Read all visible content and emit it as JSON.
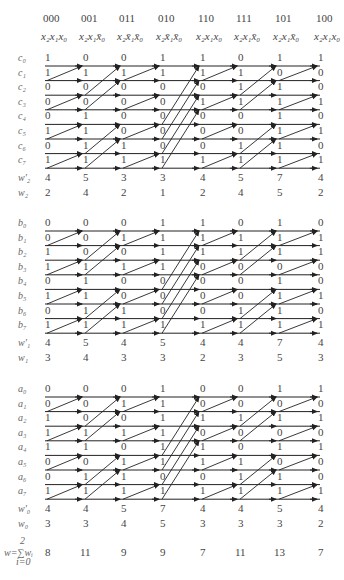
{
  "columns": [
    {
      "code": "000",
      "term": "x₂x₁x₀"
    },
    {
      "code": "001",
      "term": "x₂x₁x̄₀"
    },
    {
      "code": "011",
      "term": "x₂x̄₁x̄₀"
    },
    {
      "code": "010",
      "term": "x₂x̄₁x̄₀"
    },
    {
      "code": "110",
      "term": "x₂x₁x₀"
    },
    {
      "code": "111",
      "term": "x₂x₁x̄₀"
    },
    {
      "code": "101",
      "term": "x₂x₁x̄₀"
    },
    {
      "code": "100",
      "term": "x₂x₁x₀"
    }
  ],
  "sections": [
    {
      "name": "c",
      "row_labels": [
        "c₀",
        "c₁",
        "c₂",
        "c₃",
        "c₄",
        "c₅",
        "c₆",
        "c₇"
      ],
      "bits": [
        [
          1,
          1,
          0,
          0,
          0,
          1,
          0,
          1
        ],
        [
          0,
          1,
          0,
          0,
          1,
          1,
          1,
          1
        ],
        [
          0,
          1,
          0,
          0,
          0,
          0,
          1,
          1
        ],
        [
          1,
          1,
          0,
          0,
          0,
          0,
          0,
          1
        ],
        [
          1,
          1,
          0,
          1,
          0,
          0,
          0,
          1
        ],
        [
          0,
          1,
          1,
          1,
          0,
          0,
          1,
          1
        ],
        [
          1,
          0,
          1,
          1,
          1,
          1,
          1,
          1
        ],
        [
          1,
          0,
          0,
          1,
          0,
          1,
          0,
          1
        ]
      ],
      "wprime_label": "w'₂",
      "wprime": [
        4,
        5,
        3,
        3,
        4,
        5,
        7,
        4
      ],
      "w_label": "w₂",
      "w": [
        2,
        4,
        2,
        1,
        2,
        4,
        5,
        2
      ]
    },
    {
      "name": "b",
      "row_labels": [
        "b₀",
        "b₁",
        "b₂",
        "b₃",
        "b₄",
        "b₅",
        "b₆",
        "b₇"
      ],
      "bits": [
        [
          0,
          0,
          1,
          1,
          0,
          1,
          0,
          1
        ],
        [
          0,
          0,
          0,
          1,
          1,
          1,
          1,
          1
        ],
        [
          0,
          1,
          0,
          1,
          0,
          0,
          1,
          1
        ],
        [
          1,
          1,
          1,
          1,
          0,
          0,
          0,
          1
        ],
        [
          1,
          1,
          1,
          0,
          0,
          0,
          0,
          1
        ],
        [
          0,
          1,
          1,
          0,
          0,
          0,
          1,
          1
        ],
        [
          1,
          1,
          1,
          0,
          1,
          1,
          1,
          1
        ],
        [
          0,
          1,
          1,
          0,
          0,
          1,
          0,
          1
        ]
      ],
      "wprime_label": "w'₁",
      "wprime": [
        4,
        5,
        4,
        5,
        4,
        4,
        7,
        4
      ],
      "w_label": "w₁",
      "w": [
        3,
        4,
        3,
        3,
        2,
        3,
        5,
        3
      ]
    },
    {
      "name": "a",
      "row_labels": [
        "a₀",
        "a₁",
        "a₂",
        "a₃",
        "a₄",
        "a₅",
        "a₆",
        "a₇"
      ],
      "bits": [
        [
          0,
          0,
          1,
          1,
          1,
          0,
          0,
          1
        ],
        [
          0,
          0,
          0,
          1,
          1,
          0,
          1,
          1
        ],
        [
          0,
          1,
          0,
          1,
          0,
          1,
          1,
          1
        ],
        [
          1,
          1,
          1,
          1,
          1,
          1,
          0,
          1
        ],
        [
          0,
          0,
          1,
          0,
          1,
          1,
          0,
          1
        ],
        [
          0,
          0,
          1,
          0,
          0,
          1,
          1,
          1
        ],
        [
          1,
          0,
          1,
          0,
          1,
          0,
          1,
          1
        ],
        [
          1,
          0,
          1,
          0,
          1,
          0,
          0,
          1
        ]
      ],
      "wprime_label": "w'₀",
      "wprime": [
        4,
        4,
        5,
        7,
        4,
        4,
        5,
        4
      ],
      "w_label": "w₀",
      "w": [
        3,
        3,
        4,
        5,
        3,
        3,
        3,
        2
      ]
    }
  ],
  "total": {
    "label_top": "2",
    "label_main": "w=∑wᵢ",
    "label_bottom": "i=0",
    "values": [
      8,
      11,
      9,
      9,
      7,
      11,
      13,
      7
    ]
  },
  "stage_spans": [
    1,
    2,
    1,
    4,
    1,
    2,
    1
  ]
}
